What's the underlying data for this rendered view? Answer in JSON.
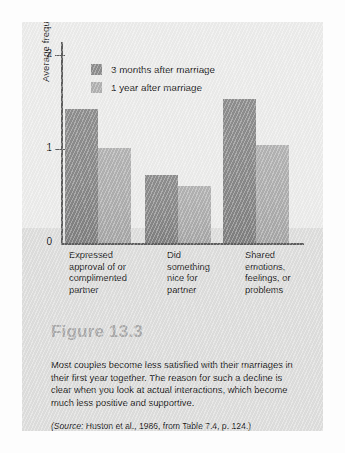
{
  "figure": {
    "number_label": "Figure 13.3",
    "body_text": "Most couples become less satisfied with their marriages in their first year together. The reason for such a decline is clear when you look at actual interactions, which become much less positive and supportive.",
    "source_prefix": "(Source:",
    "source_text": " Huston et al., 1986, from Table 7.4, p. 124.)"
  },
  "chart_data": {
    "type": "bar",
    "title": "",
    "xlabel": "",
    "ylabel": "Average frequency per day",
    "ylim": [
      0,
      2.1
    ],
    "yticks": [
      0,
      1,
      2
    ],
    "ytick_labels": [
      "0",
      "1",
      "2"
    ],
    "grid": false,
    "legend_position": "top-left",
    "categories": [
      "Expressed approval of or complimented partner",
      "Did something nice for partner",
      "Shared emotions, feelings, or problems"
    ],
    "category_lines": [
      [
        "Expressed",
        "approval of or",
        "complimented",
        "partner"
      ],
      [
        "Did",
        "something",
        "nice for",
        "partner"
      ],
      [
        "Shared",
        "emotions,",
        "feelings, or",
        "problems"
      ]
    ],
    "series": [
      {
        "name": "3 months after marriage",
        "color": "#8c8c8c",
        "values": [
          1.43,
          0.72,
          1.53
        ]
      },
      {
        "name": "1 year after marriage",
        "color": "#b0b0b0",
        "values": [
          1.01,
          0.61,
          1.04
        ]
      }
    ]
  }
}
